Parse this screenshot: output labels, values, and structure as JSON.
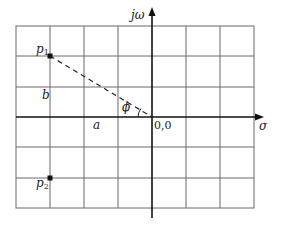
{
  "diagram": {
    "type": "s-plane pole plot",
    "axes": {
      "vertical_label": "jω",
      "horizontal_label": "σ",
      "origin_label": "0,0"
    },
    "grid": {
      "columns": 7,
      "rows": 6,
      "color": "#555555"
    },
    "poles": [
      {
        "label_main": "p",
        "label_sub": "1",
        "grid_x": -3,
        "grid_y": 2
      },
      {
        "label_main": "p",
        "label_sub": "2",
        "grid_x": -3,
        "grid_y": -2
      }
    ],
    "annotations": {
      "real_part": "a",
      "imag_part": "b",
      "angle": "ϕ"
    }
  }
}
